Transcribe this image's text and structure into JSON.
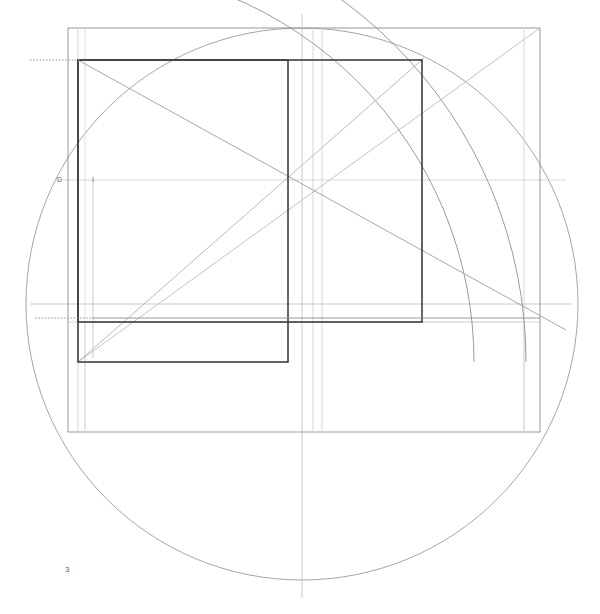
{
  "figure": {
    "title": "",
    "plate_number": "3",
    "background_color": "#ffffff",
    "width": 600,
    "height": 614
  },
  "palette": {
    "heavy": "#3b3b3b",
    "medium": "#7a7a7a",
    "light": "#b9b9b9",
    "faint": "#d4d4d4",
    "dotted": "#9a9a9a",
    "label": "#6b6b6b"
  },
  "labels": [
    {
      "name": "point-label-d",
      "text": "D",
      "x": 57,
      "y": 176
    },
    {
      "name": "point-label-i",
      "text": "I",
      "x": 92,
      "y": 176
    },
    {
      "name": "plate-number",
      "text": "3",
      "x": 65,
      "y": 565
    }
  ],
  "geometry": {
    "center": {
      "x": 302,
      "y": 304
    },
    "main_circle": {
      "cx": 302,
      "cy": 304,
      "r": 276
    },
    "outer_rectangle": {
      "x": 68,
      "y": 28,
      "width": 472,
      "height": 404
    },
    "heavy_rect_left": {
      "x": 78,
      "y": 60,
      "width": 210,
      "height": 302
    },
    "heavy_rect_right": {
      "x": 78,
      "y": 60,
      "width": 344,
      "height": 262
    },
    "vertical_axes": [
      68,
      78,
      85,
      288,
      302,
      313,
      322,
      422,
      524,
      540
    ],
    "horizontal_axes": [
      28,
      60,
      180,
      304,
      318,
      322,
      362,
      432
    ],
    "arcs": [
      {
        "name": "arc-outer-top-left",
        "cx": 78,
        "cy": 362,
        "r": 448
      },
      {
        "name": "arc-inner-top-left",
        "cx": 78,
        "cy": 362,
        "r": 396
      }
    ],
    "diagonals": [
      {
        "name": "diagonal-rising-major",
        "x1": 78,
        "y1": 362,
        "x2": 540,
        "y2": 28
      },
      {
        "name": "diagonal-rising-minor",
        "x1": 78,
        "y1": 362,
        "x2": 422,
        "y2": 60
      },
      {
        "name": "diagonal-falling",
        "x1": 78,
        "y1": 60,
        "x2": 566,
        "y2": 330
      }
    ],
    "dotted_segments": [
      {
        "name": "dotted-leader-top",
        "x1": 30,
        "y1": 60,
        "x2": 78,
        "y2": 60
      },
      {
        "name": "dotted-leader-mid",
        "x1": 35,
        "y1": 318,
        "x2": 90,
        "y2": 318
      }
    ]
  }
}
